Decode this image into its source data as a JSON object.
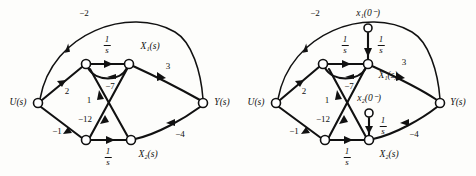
{
  "figure": {
    "panels": [
      {
        "id": "panel-left",
        "name": "signal-flow-graph-without-initial-conditions",
        "origin_x": 0,
        "nodes": [
          {
            "key": "u",
            "name": "node-u",
            "label": "U(s)",
            "cx": 38,
            "cy": 103,
            "r": 4.5,
            "label_x": 18,
            "label_y": 103
          },
          {
            "key": "a",
            "name": "node-x1dot",
            "label": "",
            "cx": 86,
            "cy": 64,
            "r": 4.5,
            "label_x": 86,
            "label_y": 56
          },
          {
            "key": "x1",
            "name": "node-x1",
            "label": "X₁(s)",
            "cx": 129,
            "cy": 64,
            "r": 4.5,
            "label_x": 150,
            "label_y": 47
          },
          {
            "key": "b",
            "name": "node-x2dot",
            "label": "",
            "cx": 86,
            "cy": 140,
            "r": 4.5,
            "label_x": 86,
            "label_y": 150
          },
          {
            "key": "x2",
            "name": "node-x2",
            "label": "X₂(s)",
            "cx": 131,
            "cy": 140,
            "r": 4.5,
            "label_x": 148,
            "label_y": 155
          },
          {
            "key": "y",
            "name": "node-y",
            "label": "Y(s)",
            "cx": 203,
            "cy": 103,
            "r": 4.5,
            "label_x": 222,
            "label_y": 103
          }
        ],
        "edges": [
          {
            "name": "edge-u-to-y-gain-minus2",
            "gain": "−2",
            "gain_x": 84,
            "gain_y": 13,
            "frac": false
          },
          {
            "name": "edge-u-to-x1dot-gain-2",
            "gain": "2",
            "gain_x": 67,
            "gain_y": 91,
            "frac": false
          },
          {
            "name": "edge-u-to-x2dot-gain-minus1",
            "gain": "−1",
            "gain_x": 57,
            "gain_y": 131,
            "frac": false
          },
          {
            "name": "edge-x1dot-to-x1-integrator",
            "gain": "1/s",
            "gain_x": 107,
            "gain_y": 45,
            "frac": true
          },
          {
            "name": "edge-x1-to-x1dot-gain-minus7",
            "gain": "−7",
            "gain_x": 110,
            "gain_y": 86,
            "frac": false
          },
          {
            "name": "edge-x2-to-x1dot-gain-1",
            "gain": "1",
            "gain_x": 89,
            "gain_y": 100,
            "frac": false
          },
          {
            "name": "edge-x1-to-x2dot-gain-minus12",
            "gain": "−12",
            "gain_x": 85,
            "gain_y": 119,
            "frac": false
          },
          {
            "name": "edge-x2dot-to-x2-integrator",
            "gain": "1/s",
            "gain_x": 108,
            "gain_y": 157,
            "frac": true
          },
          {
            "name": "edge-x1-to-y-gain-3",
            "gain": "3",
            "gain_x": 168,
            "gain_y": 66,
            "frac": false
          },
          {
            "name": "edge-x2-to-y-gain-minus4",
            "gain": "−4",
            "gain_x": 180,
            "gain_y": 134,
            "frac": false
          }
        ]
      },
      {
        "id": "panel-right",
        "name": "signal-flow-graph-with-initial-conditions",
        "origin_x": 238,
        "nodes": [
          {
            "key": "u",
            "name": "node-u",
            "label": "U(s)",
            "cx": 276,
            "cy": 103,
            "r": 4.5,
            "label_x": 256,
            "label_y": 103
          },
          {
            "key": "a",
            "name": "node-x1dot",
            "label": "",
            "cx": 323,
            "cy": 64,
            "r": 4.5,
            "label_x": 323,
            "label_y": 56
          },
          {
            "key": "x1",
            "name": "node-x1",
            "label": "X₁(s)",
            "cx": 368,
            "cy": 64,
            "r": 4.5,
            "label_x": 388,
            "label_y": 76
          },
          {
            "key": "b",
            "name": "node-x2dot",
            "label": "",
            "cx": 325,
            "cy": 140,
            "r": 4.5,
            "label_x": 325,
            "label_y": 150
          },
          {
            "key": "x2",
            "name": "node-x2",
            "label": "X₂(s)",
            "cx": 369,
            "cy": 140,
            "r": 4.5,
            "label_x": 389,
            "label_y": 155
          },
          {
            "key": "y",
            "name": "node-y",
            "label": "Y(s)",
            "cx": 440,
            "cy": 103,
            "r": 4.5,
            "label_x": 458,
            "label_y": 103
          },
          {
            "key": "ic1",
            "name": "node-x1-initial-condition",
            "label": "x₁(0⁻)",
            "cx": 368,
            "cy": 28,
            "r": 4.0,
            "label_x": 368,
            "label_y": 14
          },
          {
            "key": "ic2",
            "name": "node-x2-initial-condition",
            "label": "x₂(0⁻)",
            "cx": 369,
            "cy": 113,
            "r": 4.0,
            "label_x": 369,
            "label_y": 99
          }
        ],
        "edges": [
          {
            "name": "edge-u-to-y-gain-minus2",
            "gain": "−2",
            "gain_x": 315,
            "gain_y": 13,
            "frac": false
          },
          {
            "name": "edge-u-to-x1dot-gain-2",
            "gain": "2",
            "gain_x": 304,
            "gain_y": 91,
            "frac": false
          },
          {
            "name": "edge-u-to-x2dot-gain-minus1",
            "gain": "−1",
            "gain_x": 294,
            "gain_y": 131,
            "frac": false
          },
          {
            "name": "edge-x1dot-to-x1-integrator",
            "gain": "1/s",
            "gain_x": 345,
            "gain_y": 45,
            "frac": true
          },
          {
            "name": "edge-x1-to-x1dot-gain-minus7",
            "gain": "−7",
            "gain_x": 349,
            "gain_y": 86,
            "frac": false
          },
          {
            "name": "edge-x2-to-x1dot-gain-1",
            "gain": "1",
            "gain_x": 327,
            "gain_y": 100,
            "frac": false
          },
          {
            "name": "edge-x1-to-x2dot-gain-minus12",
            "gain": "−12",
            "gain_x": 323,
            "gain_y": 119,
            "frac": false
          },
          {
            "name": "edge-x2dot-to-x2-integrator",
            "gain": "1/s",
            "gain_x": 347,
            "gain_y": 157,
            "frac": true
          },
          {
            "name": "edge-x1-to-y-gain-3",
            "gain": "3",
            "gain_x": 404,
            "gain_y": 62,
            "frac": false
          },
          {
            "name": "edge-x2-to-y-gain-minus4",
            "gain": "−4",
            "gain_x": 414,
            "gain_y": 134,
            "frac": false
          },
          {
            "name": "edge-ic1-to-x1-integrator",
            "gain": "1/s",
            "gain_x": 381,
            "gain_y": 45,
            "frac": true
          },
          {
            "name": "edge-ic2-to-x2-integrator",
            "gain": "1/s",
            "gain_x": 383,
            "gain_y": 126,
            "frac": true
          }
        ]
      }
    ],
    "fraction": {
      "numerator": "1",
      "denominator": "s"
    },
    "colors": {
      "stroke": "#111111",
      "background": "#fdfdfb",
      "node_fill": "#ffffff"
    }
  }
}
